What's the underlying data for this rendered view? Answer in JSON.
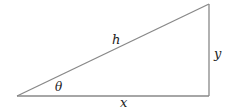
{
  "diagram": {
    "type": "right-triangle",
    "labels": {
      "hypotenuse": "h",
      "opposite": "y",
      "adjacent": "x",
      "angle": "θ"
    },
    "colors": {
      "stroke": "#888888",
      "text": "#222222",
      "background": "#ffffff"
    }
  }
}
